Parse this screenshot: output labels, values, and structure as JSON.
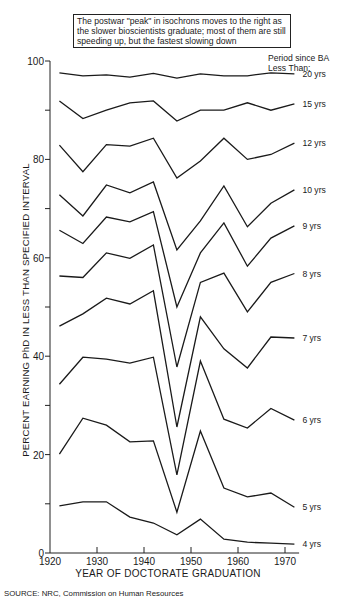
{
  "annotation": {
    "text": "The postwar \"peak\" in isochrons moves to the right as the slower bioscientists graduate; most of them are still speeding up, but the fastest slowing down"
  },
  "legend": {
    "title_line1": "Period since BA",
    "title_line2": "Less Than:"
  },
  "axes": {
    "ylabel": "PERCENT EARNING PhD IN LESS THAN SPECIFIED INTERVAL",
    "xlabel": "YEAR OF DOCTORATE GRADUATION"
  },
  "source": "SOURCE: NRC, Commission on Human Resources",
  "colors": {
    "line": "#1a1a1a",
    "axis": "#222222",
    "background": "#ffffff"
  },
  "chart_data": {
    "type": "line",
    "title": "The postwar \"peak\" in isochrons moves to the right as the slower bioscientists graduate; most of them are still speeding up, but the fastest slowing down",
    "xlabel": "YEAR OF DOCTORATE GRADUATION",
    "ylabel": "PERCENT EARNING PhD IN LESS THAN SPECIFIED INTERVAL",
    "legend_title": "Period since BA Less Than:",
    "legend_position": "right, inline labels at line ends",
    "xlim": [
      1920,
      1973
    ],
    "ylim": [
      0,
      100
    ],
    "x_ticks": [
      1920,
      1930,
      1940,
      1950,
      1960,
      1970
    ],
    "y_ticks_labeled": [
      0,
      20,
      40,
      60,
      80,
      100
    ],
    "y_ticks_minor": [
      10,
      30,
      50,
      70,
      90
    ],
    "grid": false,
    "x": [
      1922,
      1927,
      1932,
      1937,
      1942,
      1947,
      1952,
      1957,
      1962,
      1967,
      1972
    ],
    "series": [
      {
        "name": "20 yrs",
        "values": [
          97.6,
          97.0,
          97.2,
          96.7,
          97.5,
          96.5,
          97.4,
          97.0,
          97.0,
          97.6,
          97.4
        ]
      },
      {
        "name": "15 yrs",
        "values": [
          91.9,
          88.3,
          90.0,
          91.5,
          91.9,
          87.8,
          90.0,
          90.0,
          91.5,
          90.0,
          91.3
        ]
      },
      {
        "name": "12 yrs",
        "values": [
          82.9,
          77.5,
          83.0,
          82.7,
          84.3,
          76.2,
          79.7,
          84.3,
          80.0,
          81.0,
          83.3
        ]
      },
      {
        "name": "10 yrs",
        "values": [
          72.8,
          68.5,
          74.8,
          73.2,
          75.4,
          61.6,
          67.5,
          74.6,
          66.3,
          71.1,
          73.8
        ]
      },
      {
        "name": "9 yrs",
        "values": [
          65.6,
          62.9,
          68.3,
          67.3,
          69.4,
          50.0,
          61.0,
          67.1,
          58.3,
          64.0,
          66.5
        ]
      },
      {
        "name": "8 yrs",
        "values": [
          56.3,
          56.0,
          61.0,
          59.9,
          62.6,
          37.8,
          55.0,
          56.9,
          49.0,
          55.0,
          56.8
        ]
      },
      {
        "name": "7 yrs",
        "values": [
          46.1,
          48.6,
          51.8,
          50.6,
          53.3,
          25.6,
          48.0,
          41.5,
          37.6,
          43.9,
          43.7
        ]
      },
      {
        "name": "6 yrs",
        "values": [
          34.3,
          39.8,
          39.4,
          38.6,
          39.8,
          15.9,
          39.0,
          27.2,
          25.4,
          29.4,
          27.0
        ]
      },
      {
        "name": "5 yrs",
        "values": [
          20.1,
          27.4,
          26.0,
          22.6,
          22.8,
          8.3,
          24.8,
          13.2,
          11.4,
          12.2,
          9.3
        ]
      },
      {
        "name": "4 yrs",
        "values": [
          9.6,
          10.4,
          10.4,
          7.3,
          6.1,
          3.7,
          6.9,
          2.8,
          2.2,
          2.0,
          1.8
        ]
      }
    ]
  }
}
